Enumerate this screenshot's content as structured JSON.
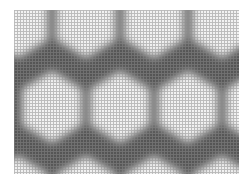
{
  "image": {
    "subject": "honeycomb hexagonal pattern with fine grid texture",
    "colors": {
      "background": "#ffffff",
      "cell_fill": "#f2f2f2",
      "border": "#5a5a5a",
      "grid_line": "#9a9a9a"
    },
    "frame": {
      "x": 14,
      "y": 10,
      "width": 225,
      "height": 164
    },
    "grid_spacing_px": 3,
    "hexagons": [
      {
        "row": 0,
        "cx": 4,
        "cy": 12
      },
      {
        "row": 0,
        "cx": 72,
        "cy": 12
      },
      {
        "row": 0,
        "cx": 140,
        "cy": 12
      },
      {
        "row": 0,
        "cx": 208,
        "cy": 12
      },
      {
        "row": 1,
        "cx": 38,
        "cy": 97
      },
      {
        "row": 1,
        "cx": 106,
        "cy": 97
      },
      {
        "row": 1,
        "cx": 174,
        "cy": 97
      },
      {
        "row": 1,
        "cx": 242,
        "cy": 97
      },
      {
        "row": 2,
        "cx": 4,
        "cy": 182
      },
      {
        "row": 2,
        "cx": 72,
        "cy": 182
      },
      {
        "row": 2,
        "cx": 140,
        "cy": 182
      },
      {
        "row": 2,
        "cx": 208,
        "cy": 182
      }
    ]
  }
}
